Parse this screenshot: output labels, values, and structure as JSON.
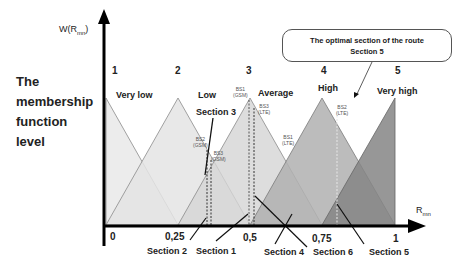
{
  "side_title": [
    "The",
    "membership",
    "function",
    "level"
  ],
  "y_axis_label": "W(R",
  "y_axis_sub": "mn",
  "y_axis_close": ")",
  "x_axis_label": "R",
  "x_axis_sub": "mn",
  "callout": {
    "line1": "The optimal section of the route",
    "line2": "Section 5"
  },
  "term_numbers": [
    "1",
    "2",
    "3",
    "4",
    "5"
  ],
  "terms": [
    "Very low",
    "Low",
    "Average",
    "High",
    "Very high"
  ],
  "x_ticks": [
    "0",
    "0,25",
    "0,5",
    "0,75",
    "1"
  ],
  "base_stations": [
    {
      "name": "BS1",
      "tech": "(GSM)"
    },
    {
      "name": "BS3",
      "tech": "(LTE)"
    },
    {
      "name": "BS2",
      "tech": "(GSM)"
    },
    {
      "name": "BS3",
      "tech": "(GSM)"
    },
    {
      "name": "BS1",
      "tech": "(LTE)"
    },
    {
      "name": "BS2",
      "tech": "(LTE)"
    }
  ],
  "sections": [
    "Section 3",
    "Section 2",
    "Section 1",
    "Section 4",
    "Section 6",
    "Section 5"
  ],
  "colors": {
    "very_low": "#ececec",
    "low": "#e2e2e2",
    "average": "#d2d2d2",
    "high": "#b4b4b4",
    "very_high": "#8c8c8c",
    "axis": "#000000"
  }
}
